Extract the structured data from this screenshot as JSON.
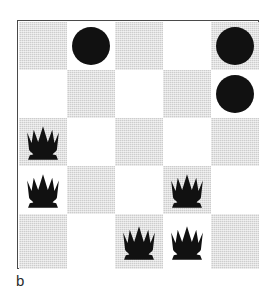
{
  "figure": {
    "caption": "b",
    "board": {
      "rows": 5,
      "cols": 5,
      "light_color": "#ffffff",
      "shade_color": "#cdcdcd",
      "piece_color": "#111111",
      "border_color": "#4a4a4a",
      "squares": [
        [
          {
            "shade": "shade",
            "piece": "none"
          },
          {
            "shade": "light",
            "piece": "disc"
          },
          {
            "shade": "shade",
            "piece": "none"
          },
          {
            "shade": "light",
            "piece": "none"
          },
          {
            "shade": "shade",
            "piece": "disc"
          }
        ],
        [
          {
            "shade": "light",
            "piece": "none"
          },
          {
            "shade": "shade",
            "piece": "none"
          },
          {
            "shade": "light",
            "piece": "none"
          },
          {
            "shade": "shade",
            "piece": "none"
          },
          {
            "shade": "light",
            "piece": "disc"
          }
        ],
        [
          {
            "shade": "shade",
            "piece": "crown"
          },
          {
            "shade": "light",
            "piece": "none"
          },
          {
            "shade": "shade",
            "piece": "none"
          },
          {
            "shade": "light",
            "piece": "none"
          },
          {
            "shade": "shade",
            "piece": "none"
          }
        ],
        [
          {
            "shade": "light",
            "piece": "crown"
          },
          {
            "shade": "shade",
            "piece": "none"
          },
          {
            "shade": "light",
            "piece": "none"
          },
          {
            "shade": "shade",
            "piece": "crown"
          },
          {
            "shade": "light",
            "piece": "none"
          }
        ],
        [
          {
            "shade": "shade",
            "piece": "none"
          },
          {
            "shade": "light",
            "piece": "none"
          },
          {
            "shade": "shade",
            "piece": "crown"
          },
          {
            "shade": "light",
            "piece": "crown"
          },
          {
            "shade": "shade",
            "piece": "none"
          }
        ]
      ],
      "piece_names": {
        "disc": "disc-piece",
        "crown": "crown-piece"
      }
    }
  }
}
